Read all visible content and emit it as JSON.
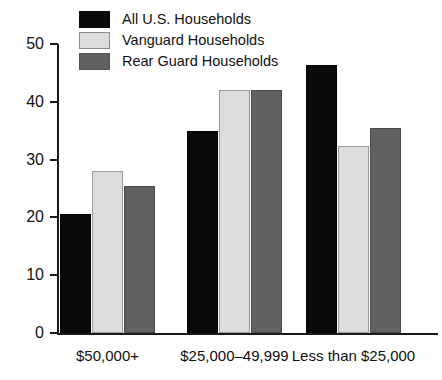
{
  "chart_data": {
    "type": "bar",
    "title": "",
    "subtitle": "",
    "xlabel": "",
    "ylabel": "",
    "ylim": [
      0,
      50
    ],
    "yticks": [
      0,
      10,
      20,
      30,
      40,
      50
    ],
    "ytick_labels": [
      "0",
      "10",
      "20",
      "30",
      "40",
      "50"
    ],
    "grid": false,
    "legend_position": "top-left",
    "categories": [
      "$50,000+",
      "$25,000–49,999",
      "Less than $25,000"
    ],
    "series": [
      {
        "name": "All U.S. Households",
        "color": "#0a0a0a",
        "values": [
          20.6,
          34.9,
          46.4
        ]
      },
      {
        "name": "Vanguard Households",
        "color": "#dcdcdc",
        "values": [
          28.1,
          42.0,
          32.4
        ]
      },
      {
        "name": "Rear Guard Households",
        "color": "#616161",
        "values": [
          25.4,
          42.0,
          35.4
        ]
      }
    ]
  },
  "legend": {
    "items": [
      {
        "label": "All U.S. Households",
        "swatch": "legend-swatch-black"
      },
      {
        "label": "Vanguard Households",
        "swatch": "legend-swatch-light-gray"
      },
      {
        "label": "Rear Guard Households",
        "swatch": "legend-swatch-dark-gray"
      }
    ]
  },
  "axis": {
    "y_ticks": [
      "50",
      "40",
      "30",
      "20",
      "10",
      "0"
    ]
  }
}
